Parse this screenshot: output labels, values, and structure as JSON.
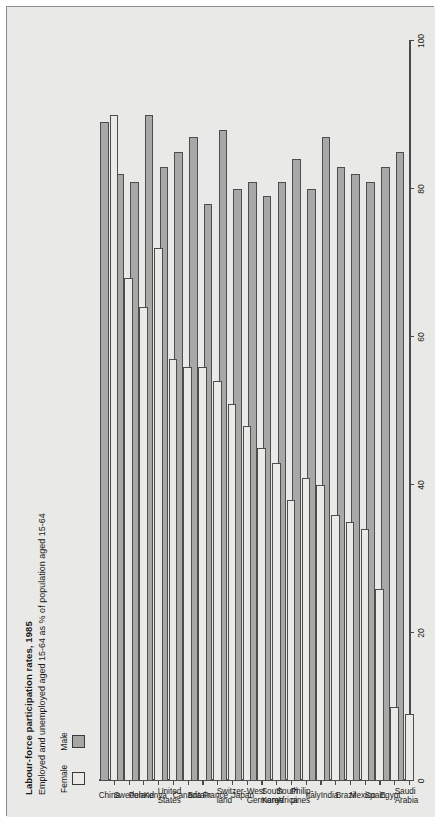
{
  "header": {
    "title": "Labour-force participation rates, 1985",
    "subtitle": "Employed and unemployed aged 15-64 as % of population aged 15-64"
  },
  "legend": {
    "position": "top-left",
    "items": [
      {
        "label": "Female",
        "swatch": "white-square",
        "color": "#eceae6"
      },
      {
        "label": "Male",
        "swatch": "grey-square",
        "color": "#a8a8a8"
      }
    ]
  },
  "colors": {
    "panel_background": "#e9e9e7",
    "male_fill": "#a8a8a8",
    "female_fill": "#eceae6",
    "bar_outline": "#4d4d4d",
    "axis": "#4a4a4a",
    "text": "#1a1a1a"
  },
  "axis": {
    "tick_labels": [
      "0",
      "20",
      "40",
      "60",
      "80",
      "100"
    ],
    "tick_values": [
      0,
      20,
      40,
      60,
      80,
      100
    ],
    "min": 0,
    "max": 100
  },
  "chart_data": {
    "type": "bar",
    "orientation": "horizontal",
    "title": "Labour-force participation rates, 1985",
    "subtitle": "Employed and unemployed aged 15-64 as % of population aged 15-64",
    "xlabel": "",
    "ylabel": "",
    "xlim": [
      0,
      100
    ],
    "grid": false,
    "legend_position": "top-left",
    "categories": [
      "Saudi\nArabia",
      "Egypt",
      "Spain",
      "Mexico",
      "Brazil",
      "India",
      "Italy",
      "Philip-\npines",
      "South\nAfrica",
      "South\nKorea",
      "West\nGermany",
      "Japan",
      "Switzer-\nland",
      "France",
      "Britain",
      "Canada",
      "United\nStates",
      "Kenya",
      "Poland",
      "Sweden",
      "China"
    ],
    "series": [
      {
        "name": "Male",
        "color": "#a8a8a8",
        "values": [
          85,
          83,
          81,
          82,
          83,
          87,
          80,
          84,
          81,
          79,
          81,
          80,
          88,
          78,
          87,
          85,
          83,
          90,
          81,
          82,
          89
        ]
      },
      {
        "name": "Female",
        "color": "#eceae6",
        "values": [
          9,
          10,
          26,
          34,
          35,
          36,
          40,
          41,
          38,
          43,
          45,
          48,
          51,
          54,
          56,
          56,
          57,
          72,
          64,
          68,
          90
        ]
      }
    ]
  }
}
